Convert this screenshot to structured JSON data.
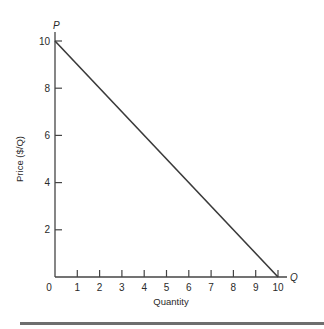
{
  "chart_data": {
    "type": "line",
    "title": "",
    "xlabel": "Quantity",
    "ylabel": "Price ($/Q)",
    "x_axis_letter": "Q",
    "y_axis_letter": "P",
    "xlim": [
      0,
      10
    ],
    "ylim": [
      0,
      10
    ],
    "x_ticks": [
      0,
      1,
      2,
      3,
      4,
      5,
      6,
      7,
      8,
      9,
      10
    ],
    "y_ticks": [
      2,
      4,
      6,
      8,
      10
    ],
    "grid": false,
    "legend": null,
    "series": [
      {
        "name": "Demand",
        "x": [
          0,
          10
        ],
        "y": [
          10,
          0
        ],
        "color": "#3a3a3a"
      }
    ]
  },
  "colors": {
    "axis": "#444444",
    "line": "#3a3a3a",
    "text": "#2a2a2a",
    "rule": "#6e6e6e"
  }
}
